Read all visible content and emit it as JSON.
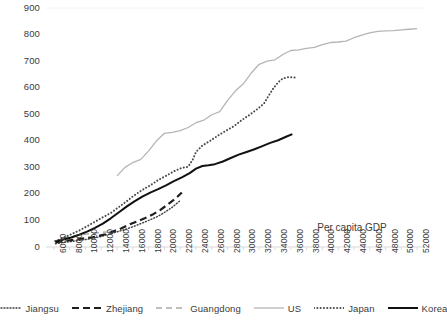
{
  "chart_data": {
    "type": "line",
    "title": "",
    "xlabel": "Per capita GDP",
    "ylabel": "",
    "xlim": [
      5000,
      53000
    ],
    "ylim": [
      0,
      900
    ],
    "grid": false,
    "legend_position": "bottom",
    "x_ticks": [
      6000,
      8000,
      10000,
      12000,
      14000,
      16000,
      18000,
      20000,
      22000,
      24000,
      26000,
      28000,
      30000,
      32000,
      34000,
      36000,
      38000,
      40000,
      42000,
      44000,
      46000,
      48000,
      50000,
      52000
    ],
    "x_tick_labels": [
      "6000",
      "8000",
      "10000",
      "12000",
      "14000",
      "16000",
      "18000",
      "20000",
      "22000",
      "24000",
      "26000",
      "28000",
      "30000",
      "32000",
      "34000",
      "36000",
      "38000",
      "40000",
      "42000",
      "44000",
      "46000",
      "48000",
      "50000",
      "52000"
    ],
    "y_ticks": [
      0,
      100,
      200,
      300,
      400,
      500,
      600,
      700,
      800,
      900
    ],
    "y_tick_labels": [
      "0",
      "100",
      "200",
      "300",
      "400",
      "500",
      "600",
      "700",
      "800",
      "900"
    ],
    "series": [
      {
        "name": "Jiangsu",
        "style": "dotted",
        "color": "#3f3f3f",
        "width": 1.4,
        "points": [
          [
            6200,
            12
          ],
          [
            7000,
            16
          ],
          [
            8000,
            20
          ],
          [
            9000,
            24
          ],
          [
            10000,
            28
          ],
          [
            11000,
            33
          ],
          [
            12000,
            40
          ],
          [
            13000,
            48
          ],
          [
            14000,
            57
          ],
          [
            15000,
            66
          ],
          [
            16000,
            76
          ],
          [
            17000,
            88
          ],
          [
            18000,
            100
          ],
          [
            19000,
            113
          ],
          [
            20000,
            130
          ],
          [
            21000,
            150
          ],
          [
            22000,
            175
          ]
        ]
      },
      {
        "name": "Zhejiang",
        "style": "dashed-bold",
        "color": "#1e1e1e",
        "width": 2.2,
        "points": [
          [
            6200,
            18
          ],
          [
            7200,
            22
          ],
          [
            8200,
            26
          ],
          [
            9500,
            31
          ],
          [
            10500,
            35
          ],
          [
            11500,
            40
          ],
          [
            12500,
            48
          ],
          [
            13500,
            58
          ],
          [
            14500,
            70
          ],
          [
            15500,
            84
          ],
          [
            16500,
            96
          ],
          [
            17500,
            108
          ],
          [
            18500,
            122
          ],
          [
            19500,
            140
          ],
          [
            20500,
            162
          ],
          [
            21500,
            185
          ],
          [
            22200,
            205
          ]
        ]
      },
      {
        "name": "Guangdong",
        "style": "dashed-light",
        "color": "#aaaaaa",
        "width": 1.4,
        "points": [
          [
            6000,
            22
          ],
          [
            7000,
            30
          ],
          [
            8000,
            38
          ],
          [
            9000,
            44
          ],
          [
            10000,
            48
          ],
          [
            11000,
            52
          ],
          [
            12000,
            55
          ],
          [
            12800,
            57
          ]
        ]
      },
      {
        "name": "US",
        "style": "solid-light",
        "color": "#b5b5b5",
        "width": 1.3,
        "points": [
          [
            14000,
            268
          ],
          [
            15000,
            300
          ],
          [
            16000,
            318
          ],
          [
            17000,
            330
          ],
          [
            18000,
            362
          ],
          [
            19000,
            400
          ],
          [
            20000,
            428
          ],
          [
            21000,
            432
          ],
          [
            22000,
            438
          ],
          [
            23000,
            450
          ],
          [
            24000,
            468
          ],
          [
            25000,
            478
          ],
          [
            26000,
            498
          ],
          [
            27000,
            510
          ],
          [
            28000,
            552
          ],
          [
            29000,
            588
          ],
          [
            30000,
            615
          ],
          [
            31000,
            655
          ],
          [
            32000,
            688
          ],
          [
            33000,
            700
          ],
          [
            34000,
            705
          ],
          [
            35000,
            725
          ],
          [
            36000,
            740
          ],
          [
            37000,
            742
          ],
          [
            38000,
            748
          ],
          [
            39000,
            752
          ],
          [
            40000,
            762
          ],
          [
            41000,
            770
          ],
          [
            42000,
            772
          ],
          [
            43000,
            775
          ],
          [
            44000,
            788
          ],
          [
            45000,
            798
          ],
          [
            46000,
            806
          ],
          [
            47000,
            812
          ],
          [
            48000,
            814
          ],
          [
            49000,
            815
          ],
          [
            50000,
            818
          ],
          [
            51000,
            820
          ],
          [
            52000,
            822
          ]
        ]
      },
      {
        "name": "Japan",
        "style": "dotted-bold",
        "color": "#4a4a4a",
        "width": 2.0,
        "points": [
          [
            6200,
            22
          ],
          [
            7200,
            35
          ],
          [
            8200,
            48
          ],
          [
            9200,
            62
          ],
          [
            10200,
            78
          ],
          [
            11200,
            95
          ],
          [
            12200,
            112
          ],
          [
            13200,
            128
          ],
          [
            14200,
            150
          ],
          [
            15200,
            172
          ],
          [
            16200,
            195
          ],
          [
            17200,
            215
          ],
          [
            18200,
            232
          ],
          [
            19200,
            252
          ],
          [
            20200,
            268
          ],
          [
            21200,
            285
          ],
          [
            22200,
            298
          ],
          [
            23000,
            302
          ],
          [
            23600,
            330
          ],
          [
            24000,
            358
          ],
          [
            24800,
            382
          ],
          [
            25800,
            400
          ],
          [
            26800,
            420
          ],
          [
            27800,
            438
          ],
          [
            28800,
            455
          ],
          [
            29800,
            478
          ],
          [
            30800,
            498
          ],
          [
            31800,
            520
          ],
          [
            32600,
            540
          ],
          [
            33200,
            570
          ],
          [
            33800,
            598
          ],
          [
            34400,
            620
          ],
          [
            35000,
            635
          ],
          [
            35800,
            640
          ],
          [
            36600,
            638
          ]
        ]
      },
      {
        "name": "Korea",
        "style": "solid-bold",
        "color": "#111111",
        "width": 2.0,
        "points": [
          [
            6200,
            20
          ],
          [
            7200,
            28
          ],
          [
            8200,
            36
          ],
          [
            9200,
            46
          ],
          [
            10200,
            58
          ],
          [
            11200,
            72
          ],
          [
            12200,
            88
          ],
          [
            13200,
            108
          ],
          [
            14200,
            130
          ],
          [
            15200,
            152
          ],
          [
            16200,
            172
          ],
          [
            17200,
            190
          ],
          [
            18200,
            205
          ],
          [
            19200,
            218
          ],
          [
            20200,
            232
          ],
          [
            21200,
            248
          ],
          [
            22200,
            262
          ],
          [
            23200,
            278
          ],
          [
            24000,
            295
          ],
          [
            24800,
            305
          ],
          [
            25600,
            308
          ],
          [
            26400,
            312
          ],
          [
            27400,
            322
          ],
          [
            28400,
            335
          ],
          [
            29400,
            348
          ],
          [
            30400,
            358
          ],
          [
            31400,
            368
          ],
          [
            32400,
            380
          ],
          [
            33400,
            392
          ],
          [
            34400,
            402
          ],
          [
            35400,
            415
          ],
          [
            36200,
            425
          ]
        ]
      }
    ]
  },
  "legend": {
    "items": [
      {
        "label": "Jiangsu",
        "style": "dotted"
      },
      {
        "label": "Zhejiang",
        "style": "dashed-bold"
      },
      {
        "label": "Guangdong",
        "style": "dashed-light"
      },
      {
        "label": "US",
        "style": "solid-light"
      },
      {
        "label": "Japan",
        "style": "dotted-bold"
      },
      {
        "label": "Korea",
        "style": "solid-bold"
      }
    ]
  },
  "colors": {
    "background": "#ffffff",
    "text": "#3b3b3b",
    "axis": "#d9d9d9"
  }
}
